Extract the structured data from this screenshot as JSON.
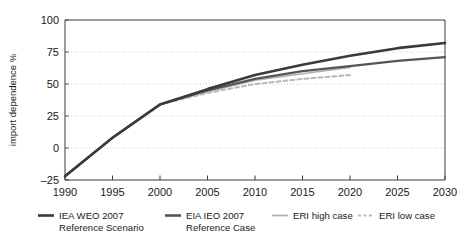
{
  "chart_data": {
    "type": "line",
    "title": "",
    "subtitle": "",
    "xlabel": "",
    "ylabel": "import dependence %",
    "xlim": [
      1990,
      2030
    ],
    "ylim": [
      -25,
      100
    ],
    "xticks": [
      1990,
      1995,
      2000,
      2005,
      2010,
      2015,
      2020,
      2025,
      2030
    ],
    "yticks": [
      -25,
      0,
      25,
      50,
      75,
      100
    ],
    "grid": "horizontal-dotted",
    "legend_position": "below",
    "series": [
      {
        "name": "IEA WEO 2007 Reference Scenario",
        "legend_label_line1": "IEA WEO 2007",
        "legend_label_line2": "Reference Scenario",
        "color": "#3a3a3a",
        "style": "solid",
        "width": 2.6,
        "x": [
          1990,
          1995,
          2000,
          2005,
          2010,
          2015,
          2020,
          2025,
          2030
        ],
        "y": [
          -22,
          8,
          34,
          46,
          57,
          65,
          72,
          78,
          82
        ]
      },
      {
        "name": "EIA IEO 2007 Reference Case",
        "legend_label_line1": "EIA IEO 2007",
        "legend_label_line2": "Reference Case",
        "color": "#555555",
        "style": "solid",
        "width": 2.2,
        "x": [
          1990,
          1995,
          2000,
          2005,
          2010,
          2015,
          2020,
          2025,
          2030
        ],
        "y": [
          -22,
          8,
          34,
          45,
          54,
          60,
          64,
          68,
          71
        ]
      },
      {
        "name": "ERI high case",
        "legend_label_line1": "ERI high case",
        "legend_label_line2": "",
        "color": "#b0b0b0",
        "style": "solid",
        "width": 1.6,
        "x": [
          1990,
          1995,
          2000,
          2005,
          2010,
          2015,
          2020
        ],
        "y": [
          -22,
          8,
          34,
          44,
          53,
          58,
          63
        ]
      },
      {
        "name": "ERI low case",
        "legend_label_line1": "ERI low case",
        "legend_label_line2": "",
        "color": "#b8b8b8",
        "style": "dashed",
        "width": 2.0,
        "x": [
          1990,
          1995,
          2000,
          2005,
          2010,
          2015,
          2020
        ],
        "y": [
          -22,
          8,
          34,
          43,
          50,
          54,
          57
        ]
      }
    ]
  },
  "axis": {
    "ylabel": "import dependence %",
    "yticks": [
      "100",
      "75",
      "50",
      "25",
      "0",
      "–25"
    ],
    "xticks": [
      "1990",
      "1995",
      "2000",
      "2005",
      "2010",
      "2015",
      "2020",
      "2025",
      "2030"
    ]
  },
  "legend": {
    "items": [
      {
        "line1": "IEA WEO 2007",
        "line2": "Reference Scenario",
        "swatch": "solid-dark",
        "color": "#3a3a3a"
      },
      {
        "line1": "EIA IEO 2007",
        "line2": "Reference Case",
        "swatch": "solid-dark",
        "color": "#555555"
      },
      {
        "line1": "ERI high case",
        "line2": "",
        "swatch": "solid-light",
        "color": "#b0b0b0"
      },
      {
        "line1": "ERI low case",
        "line2": "",
        "swatch": "dashed-light",
        "color": "#b8b8b8"
      }
    ]
  },
  "colors": {
    "axis": "#3a3a3a",
    "grid": "#c8c8c8",
    "background": "#ffffff"
  }
}
